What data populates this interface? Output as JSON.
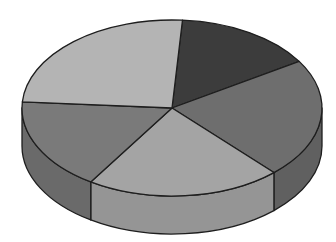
{
  "chart_data": {
    "type": "pie",
    "variant": "3d",
    "title": "",
    "legend": null,
    "labels": [
      "",
      "",
      "",
      "",
      ""
    ],
    "values": [
      15,
      22,
      21,
      17,
      25
    ],
    "unit": "percent (estimated from slice angles; no labels shown)",
    "colors": [
      "#3c3c3c",
      "#6e6e6e",
      "#a4a4a4",
      "#7a7a7a",
      "#b4b4b4"
    ],
    "side_colors": [
      "#333333",
      "#606060",
      "#959595",
      "#6a6a6a",
      "#a0a0a0"
    ],
    "start_angle_deg": -86,
    "direction": "clockwise",
    "geometry": {
      "cx": 172,
      "cy": 108,
      "rx": 150,
      "ry": 88,
      "depth": 38
    },
    "outline_color": "#1e1e1e",
    "grid": false
  }
}
